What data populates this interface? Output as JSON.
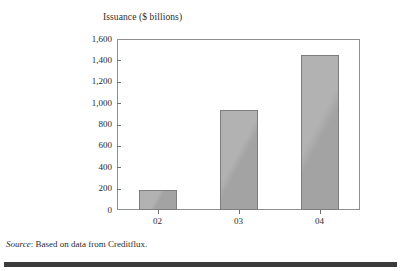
{
  "chart_data": {
    "type": "bar",
    "title": "Issuance ($ billions)",
    "xlabel": "",
    "ylabel": "Issuance ($ billions)",
    "categories": [
      "02",
      "03",
      "04"
    ],
    "values": [
      190,
      940,
      1450
    ],
    "ylim": [
      0,
      1600
    ],
    "ytick_labels": [
      "0",
      "200",
      "400",
      "600",
      "800",
      "1,000",
      "1,200",
      "1,400",
      "1,600"
    ],
    "ytick_values": [
      0,
      200,
      400,
      600,
      800,
      1000,
      1200,
      1400,
      1600
    ],
    "grid": false,
    "legend": null,
    "series": [
      {
        "name": "Issuance",
        "values": [
          190,
          940,
          1450
        ]
      }
    ],
    "bar_color": "#a9a9a9",
    "bar_edge_color": "#7d7d7d",
    "axis_color": "#8e8e8e"
  },
  "figure": {
    "axis_title": "Issuance ($ billions)",
    "source_label": "Source",
    "source_separator": ": ",
    "source_text": "Based on data from Creditflux."
  }
}
